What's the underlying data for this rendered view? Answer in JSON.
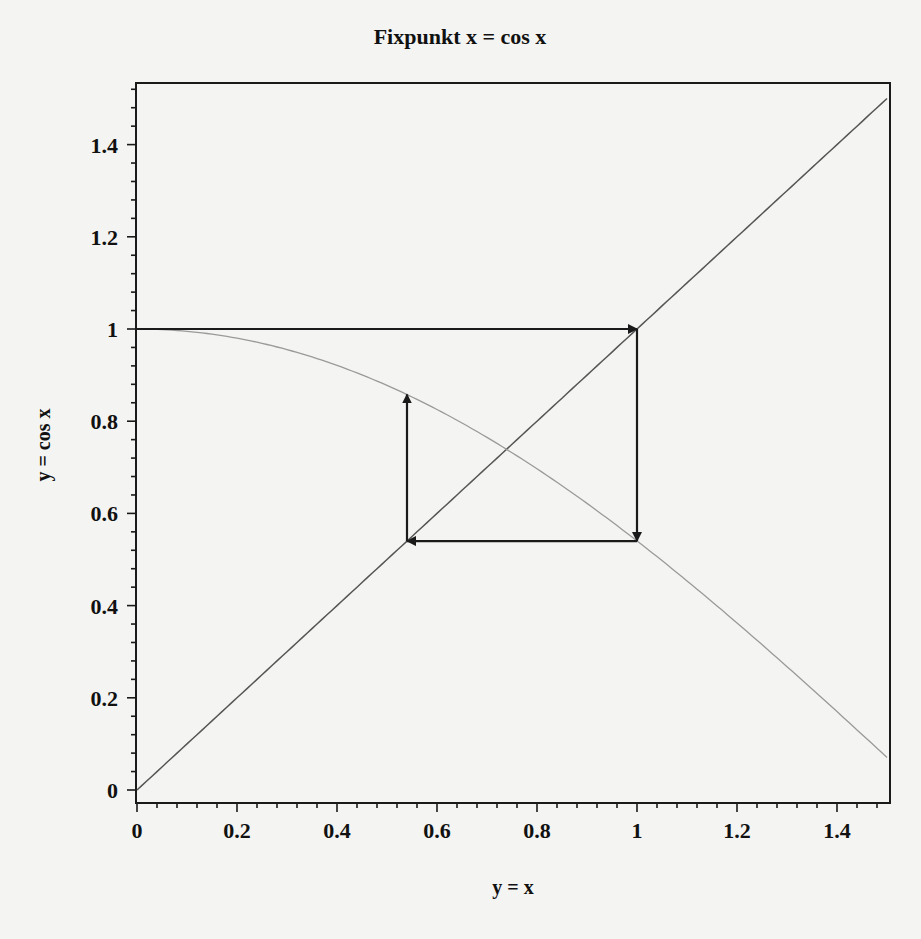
{
  "chart_data": {
    "type": "line",
    "title": "Fixpunkt x = cos x",
    "xlabel": "y = x",
    "ylabel": "y = cos x",
    "xlim": [
      0,
      1.5
    ],
    "ylim": [
      0,
      1.5
    ],
    "grid": false,
    "x_ticks": [
      "0",
      "0.2",
      "0.4",
      "0.6",
      "0.8",
      "1",
      "1.2",
      "1.4"
    ],
    "x_tick_values": [
      0,
      0.2,
      0.4,
      0.6,
      0.8,
      1.0,
      1.2,
      1.4
    ],
    "y_ticks": [
      "0",
      "0.2",
      "0.4",
      "0.6",
      "0.8",
      "1",
      "1.2",
      "1.4"
    ],
    "y_tick_values": [
      0,
      0.2,
      0.4,
      0.6,
      0.8,
      1.0,
      1.2,
      1.4
    ],
    "series": [
      {
        "name": "y = x",
        "function": "x",
        "color": "#555555",
        "x": [
          0,
          1.5
        ],
        "y": [
          0,
          1.5
        ]
      },
      {
        "name": "y = cos x",
        "function": "cos(x)",
        "color": "#9a9a9a",
        "x": [
          0,
          0.25,
          0.5,
          0.75,
          1.0,
          1.25,
          1.5
        ],
        "y": [
          1.0,
          0.969,
          0.878,
          0.732,
          0.54,
          0.315,
          0.071
        ]
      }
    ],
    "annotations": {
      "iteration_arrows": [
        {
          "from": [
            0,
            1.0
          ],
          "to": [
            1.0,
            1.0
          ]
        },
        {
          "from": [
            1.0,
            1.0
          ],
          "to": [
            1.0,
            0.54
          ]
        },
        {
          "from": [
            1.0,
            0.54
          ],
          "to": [
            0.54,
            0.54
          ]
        },
        {
          "from": [
            0.54,
            0.54
          ],
          "to": [
            0.54,
            0.858
          ]
        }
      ],
      "arrow_color": "#1a1a1a"
    }
  }
}
